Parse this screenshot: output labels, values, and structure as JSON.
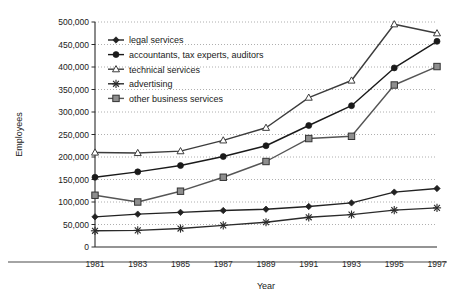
{
  "chart_data": {
    "type": "line",
    "title": "",
    "xlabel": "Year",
    "ylabel": "Employees",
    "x": [
      1981,
      1983,
      1985,
      1987,
      1989,
      1991,
      1993,
      1995,
      1997
    ],
    "xtick_labels": [
      "1981",
      "1983",
      "1985",
      "1987",
      "1989",
      "1991",
      "1993",
      "1995",
      "1997"
    ],
    "ytick_labels": [
      "0",
      "50,000",
      "100,000",
      "150,000",
      "200,000",
      "250,000",
      "300,000",
      "350,000",
      "400,000",
      "450,000",
      "500,000"
    ],
    "ytick_values": [
      0,
      50000,
      100000,
      150000,
      200000,
      250000,
      300000,
      350000,
      400000,
      450000,
      500000
    ],
    "ylim": [
      0,
      500000
    ],
    "xlim": [
      1981,
      1997
    ],
    "grid": true,
    "grid_style": "dotted-horizontal",
    "legend_position": "upper-left-inside",
    "series": [
      {
        "name": "legal services",
        "marker": "diamond",
        "color": "#222222",
        "values": [
          67000,
          73000,
          77000,
          81000,
          84000,
          90000,
          98000,
          122000,
          130000
        ]
      },
      {
        "name": "accountants, tax experts, auditors",
        "marker": "circle",
        "color": "#1a1a1a",
        "values": [
          155000,
          167000,
          181000,
          201000,
          225000,
          270000,
          314000,
          398000,
          457000
        ]
      },
      {
        "name": "technical services",
        "marker": "triangle-open",
        "color": "#3c3c3c",
        "values": [
          210000,
          209000,
          213000,
          237000,
          265000,
          332000,
          370000,
          495000,
          475000
        ]
      },
      {
        "name": "advertising",
        "marker": "asterisk",
        "color": "#2b2b2b",
        "values": [
          36000,
          37000,
          41000,
          48000,
          55000,
          66000,
          72000,
          82000,
          87000
        ]
      },
      {
        "name": "other business services",
        "marker": "square-open",
        "color": "#555555",
        "values": [
          115000,
          100000,
          124000,
          155000,
          190000,
          241000,
          246000,
          360000,
          401000
        ]
      }
    ]
  },
  "legend": {
    "items": [
      {
        "label": "legal services"
      },
      {
        "label": "accountants, tax experts, auditors"
      },
      {
        "label": "technical services"
      },
      {
        "label": "advertising"
      },
      {
        "label": "other business services"
      }
    ]
  },
  "axes": {
    "y_title": "Employees",
    "x_title": "Year"
  }
}
